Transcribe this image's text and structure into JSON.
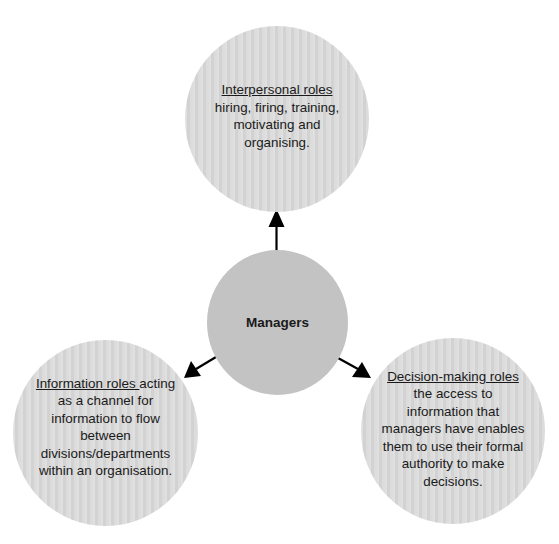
{
  "diagram": {
    "center": {
      "label": "Managers",
      "color": "#c3c3c3"
    },
    "nodes": [
      {
        "id": "interpersonal",
        "title": "Interpersonal roles",
        "lines": [
          "hiring, firing, training,",
          "motivating and",
          "organising."
        ]
      },
      {
        "id": "information",
        "title": "Information roles ",
        "title_suffix": "acting",
        "lines": [
          "as a channel for",
          "information to flow",
          "between",
          "divisions/departments",
          "within an organisation."
        ]
      },
      {
        "id": "decision",
        "title": "Decision-making roles",
        "lines": [
          "the access to",
          "information that",
          "managers have enables",
          "them to use their formal",
          "authority to make",
          "decisions."
        ]
      }
    ],
    "colors": {
      "outer_fill": "#d9d9d9",
      "arrow": "#000000",
      "text": "#1a1a1a"
    }
  }
}
